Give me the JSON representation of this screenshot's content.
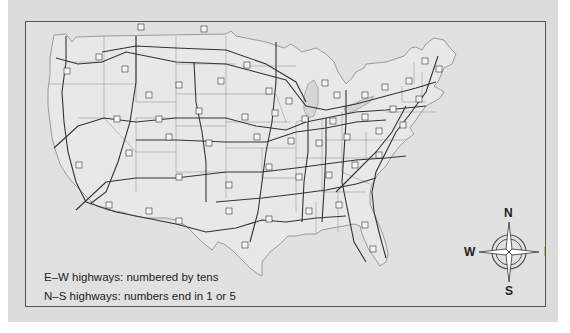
{
  "map": {
    "title": "U.S. Interstate Highway System",
    "legend": {
      "line1": "E–W highways: numbered by tens",
      "line2": "N–S highways: numbers end in 1 or 5"
    },
    "compass": {
      "north": "N",
      "south": "S",
      "east": "E",
      "west": "W"
    },
    "colors": {
      "background": "#e1e1e1",
      "land": "#e6e6e6",
      "ocean": "#d9d9d9",
      "highway": "#3a3a3a",
      "state_border": "#8a8a8a",
      "frame": "#555555"
    }
  }
}
